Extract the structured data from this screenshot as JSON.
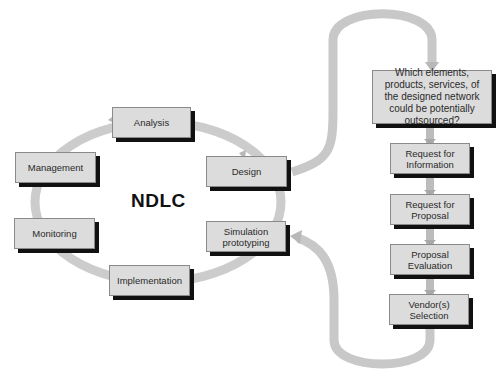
{
  "title": "NDLC",
  "cycle": {
    "nodes": [
      {
        "id": "analysis",
        "label": "Analysis"
      },
      {
        "id": "design",
        "label": "Design"
      },
      {
        "id": "simulation",
        "label": "Simulation prototyping"
      },
      {
        "id": "implementation",
        "label": "Implementation"
      },
      {
        "id": "monitoring",
        "label": "Monitoring"
      },
      {
        "id": "management",
        "label": "Management"
      }
    ]
  },
  "outsourcing": {
    "question": "Which elements, products, services, of the designed network could be potentially outsourced?",
    "steps": [
      {
        "id": "rfi",
        "label": "Request for Information"
      },
      {
        "id": "rfp",
        "label": "Request for Proposal"
      },
      {
        "id": "eval",
        "label": "Proposal Evaluation"
      },
      {
        "id": "vendor",
        "label": "Vendor(s) Selection"
      }
    ]
  },
  "colors": {
    "box_fill": "#dcdcdc",
    "box_shadow": "#111111",
    "arrow": "#c8c8c8"
  }
}
